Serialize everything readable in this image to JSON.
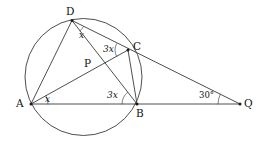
{
  "figure": {
    "background_color": "#ffffff",
    "stroke_color": "#3a3a3a",
    "text_color": "#111111"
  },
  "circle": {
    "center_x": 83.5,
    "center_y": 77.0,
    "radius": 58.5
  },
  "points": [
    {
      "id": "D",
      "label": "D",
      "x": 72,
      "y": 20.5,
      "label_x": 66,
      "label_y": 6,
      "on_circle": true
    },
    {
      "id": "C",
      "label": "C",
      "x": 128,
      "y": 50,
      "label_x": 133,
      "label_y": 41,
      "on_circle": true
    },
    {
      "id": "B",
      "label": "B",
      "x": 137,
      "y": 104,
      "label_x": 136,
      "label_y": 108,
      "on_circle": true
    },
    {
      "id": "A",
      "label": "A",
      "x": 31,
      "y": 104,
      "label_x": 16,
      "label_y": 98,
      "on_circle": true
    },
    {
      "id": "Q",
      "label": "Q",
      "x": 240,
      "y": 104,
      "label_x": 244,
      "label_y": 98,
      "on_circle": false
    },
    {
      "id": "P",
      "label": "P",
      "x": 100,
      "y": 68,
      "label_x": 84,
      "label_y": 58,
      "on_circle": false
    }
  ],
  "segments": [
    {
      "id": "DA",
      "from": "D",
      "to": "A"
    },
    {
      "id": "DB",
      "from": "D",
      "to": "B"
    },
    {
      "id": "DQ",
      "from": "D",
      "to": "Q"
    },
    {
      "id": "AC",
      "from": "A",
      "to": "C"
    },
    {
      "id": "AQ",
      "from": "A",
      "to": "Q"
    },
    {
      "id": "BC",
      "from": "B",
      "to": "C"
    }
  ],
  "angle_labels": [
    {
      "id": "angle-at-D",
      "text": "x",
      "vertex": "D",
      "x": 79,
      "y": 31,
      "style": "italic"
    },
    {
      "id": "angle-at-C",
      "text": "3x",
      "vertex": "C",
      "x": 103,
      "y": 45,
      "style": "italic"
    },
    {
      "id": "angle-at-A",
      "text": "x",
      "vertex": "A",
      "x": 45,
      "y": 95,
      "style": "italic"
    },
    {
      "id": "angle-at-B",
      "text": "3x",
      "vertex": "B",
      "x": 107,
      "y": 91,
      "style": "italic"
    },
    {
      "id": "angle-at-Q",
      "text": "30°",
      "vertex": "Q",
      "x": 199,
      "y": 91,
      "style": "normal"
    }
  ],
  "angle_arcs": [
    {
      "id": "arc-D",
      "vertex": "D",
      "radius": 14
    },
    {
      "id": "arc-C",
      "vertex": "C",
      "radius": 12
    },
    {
      "id": "arc-A",
      "vertex": "A",
      "radius": 16
    },
    {
      "id": "arc-B",
      "vertex": "B",
      "radius": 14
    },
    {
      "id": "arc-Q",
      "vertex": "Q",
      "radius": 20
    }
  ],
  "chart_data": {
    "type": "diagram",
    "subtype": "euclidean-geometry",
    "circle": {
      "center": [
        83.5,
        77.0
      ],
      "radius": 58.5
    },
    "vertices": {
      "A": [
        31,
        104
      ],
      "B": [
        137,
        104
      ],
      "C": [
        128,
        50
      ],
      "D": [
        72,
        20.5
      ],
      "P": [
        100,
        68
      ],
      "Q": [
        240,
        104
      ]
    },
    "lines": [
      [
        "D",
        "A"
      ],
      [
        "D",
        "B"
      ],
      [
        "D",
        "C",
        "Q"
      ],
      [
        "A",
        "P",
        "C"
      ],
      [
        "A",
        "B",
        "Q"
      ],
      [
        "B",
        "C"
      ]
    ],
    "labeled_angles": [
      {
        "at": "D",
        "value": "x",
        "description": "angle BDC"
      },
      {
        "at": "C",
        "value": "3x",
        "description": "angle DCA"
      },
      {
        "at": "A",
        "value": "x",
        "description": "angle BAC"
      },
      {
        "at": "B",
        "value": "3x",
        "description": "angle DBA"
      },
      {
        "at": "Q",
        "value": "30°",
        "description": "angle at external point Q"
      }
    ]
  }
}
